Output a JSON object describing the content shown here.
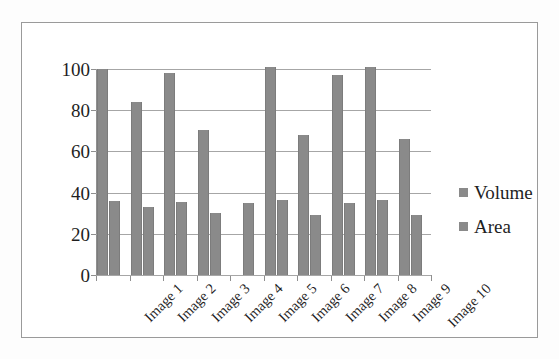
{
  "chart_data": {
    "type": "bar",
    "title": "",
    "xlabel": "",
    "ylabel": "",
    "categories": [
      "Image 1",
      "Image 2",
      "Image 3",
      "Image 4",
      "Image 5",
      "Image 6",
      "Image 7",
      "Image 8",
      "Image 9",
      "Image 10"
    ],
    "series": [
      {
        "name": "Volume",
        "values": [
          100,
          84,
          98,
          70.5,
          null,
          101,
          68,
          97,
          101,
          66
        ]
      },
      {
        "name": "Area",
        "values": [
          36,
          33,
          35.5,
          30,
          35,
          36.5,
          29,
          35,
          36.5,
          29
        ]
      }
    ],
    "ylim": [
      0,
      100
    ],
    "ytick_labels": [
      "100",
      "80",
      "60",
      "40",
      "20",
      "0"
    ],
    "ytick_values": [
      100,
      80,
      60,
      40,
      20,
      0
    ],
    "grid": "horizontal",
    "legend_position": "right",
    "bar_color": "#8a8a8a",
    "gridline_color": "#a6a6a6",
    "axis_color": "#8f8f8f",
    "frame_color": "#9a9a9a",
    "background_color": "#ffffff"
  },
  "legend": {
    "items": [
      {
        "label": "Volume",
        "color": "#8a8a8a"
      },
      {
        "label": "Area",
        "color": "#8a8a8a"
      }
    ]
  }
}
